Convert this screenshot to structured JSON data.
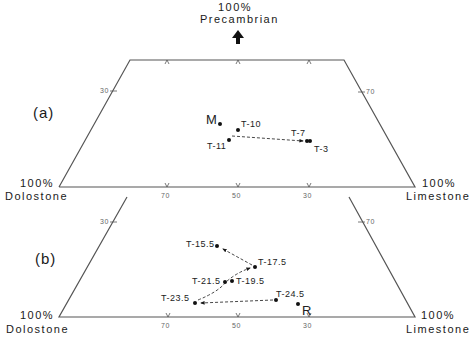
{
  "apex_label": {
    "pct": "100%",
    "name": "Precambrian"
  },
  "corners": {
    "left": {
      "pct": "100%",
      "name": "Dolostone"
    },
    "right": {
      "pct": "100%",
      "name": "Limestone"
    }
  },
  "panels": [
    {
      "id": "a",
      "label": "(a)",
      "bottom_ticks": [
        "70",
        "50",
        "30"
      ],
      "left_tick": "30",
      "right_tick": "70",
      "points": [
        {
          "name": "M",
          "x": 220,
          "y": 124
        },
        {
          "name": "T-10",
          "x": 238,
          "y": 130
        },
        {
          "name": "T-11",
          "x": 229,
          "y": 140
        },
        {
          "name": "T-7",
          "x": 307,
          "y": 141
        },
        {
          "name": "T-3",
          "x": 310,
          "y": 141
        }
      ],
      "paths": [
        {
          "from": "T-11",
          "to": "T-7"
        }
      ]
    },
    {
      "id": "b",
      "label": "(b)",
      "bottom_ticks": [
        "70",
        "50",
        "30"
      ],
      "left_tick": "30",
      "right_tick": "70",
      "points": [
        {
          "name": "T-15.5",
          "x": 217,
          "y": 246
        },
        {
          "name": "T-17.5",
          "x": 255,
          "y": 267
        },
        {
          "name": "T-21.5",
          "x": 225,
          "y": 282
        },
        {
          "name": "T-19.5",
          "x": 232,
          "y": 281
        },
        {
          "name": "T-23.5",
          "x": 195,
          "y": 303
        },
        {
          "name": "T-24.5",
          "x": 276,
          "y": 300
        },
        {
          "name": "R",
          "x": 298,
          "y": 304
        }
      ],
      "paths": [
        {
          "from": "T-24.5",
          "to": "T-23.5"
        },
        {
          "from": "T-23.5",
          "to": "T-17.5",
          "via": "T-21.5"
        },
        {
          "from": "T-17.5",
          "to": "T-15.5"
        }
      ]
    }
  ],
  "colors": {
    "ink": "#1a1a1a",
    "frame": "#555555",
    "tick_text": "#666666"
  }
}
